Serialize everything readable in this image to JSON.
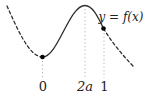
{
  "figure": {
    "function_label": "y = f(x)",
    "x_tick_labels": [
      {
        "position": "0",
        "text": "0"
      },
      {
        "position": "2a",
        "text": "2a"
      },
      {
        "position": "1",
        "text": "1"
      }
    ],
    "curve_description": {
      "style_left_of_0": "dashed",
      "style_between_0_and_1": "solid",
      "style_right_of_1": "dashed",
      "local_minimum_above_label": "0",
      "local_maximum_above_label": "2a",
      "marked_points_above_labels": [
        "0",
        "1"
      ]
    },
    "colors": {
      "curve": "#2f2f2f",
      "point_marker": "#000000",
      "guide_line": "#b8b8b8",
      "label_text": "#222222",
      "background": "#ffffff"
    }
  }
}
